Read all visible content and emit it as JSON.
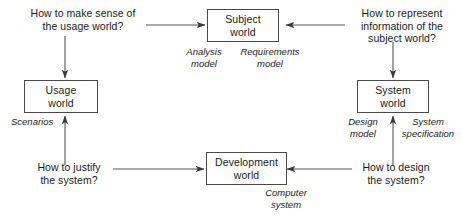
{
  "diagram": {
    "canvas": {
      "width": 462,
      "height": 222,
      "background": "#ffffff"
    },
    "stroke_color": "#555555",
    "box_border_color": "#4a4a4a",
    "text_color": "#1a1a1a",
    "nodes": [
      {
        "id": "usage-world",
        "line1": "Usage",
        "line2": "world"
      },
      {
        "id": "subject-world",
        "line1": "Subject",
        "line2": "world"
      },
      {
        "id": "system-world",
        "line1": "System",
        "line2": "world"
      },
      {
        "id": "development-world",
        "line1": "Development",
        "line2": "world"
      }
    ],
    "questions": [
      {
        "id": "question-usage",
        "line1": "How to make sense of",
        "line2": "the usage world?",
        "line3": ""
      },
      {
        "id": "question-subject",
        "line1": "How to represent",
        "line2": "information of the",
        "line3": "subject world?"
      },
      {
        "id": "question-justify",
        "line1": "How to justify",
        "line2": "the system?",
        "line3": ""
      },
      {
        "id": "question-design",
        "line1": "How to design",
        "line2": "the system?",
        "line3": ""
      }
    ],
    "edge_labels": [
      {
        "id": "analysis-model",
        "line1": "Analysis",
        "line2": "model"
      },
      {
        "id": "requirements-model",
        "line1": "Requirements",
        "line2": "model"
      },
      {
        "id": "scenarios",
        "line1": "Scenarios",
        "line2": ""
      },
      {
        "id": "design-model",
        "line1": "Design",
        "line2": "model"
      },
      {
        "id": "system-specification",
        "line1": "System",
        "line2": "specification"
      },
      {
        "id": "computer-system",
        "line1": "Computer",
        "line2": "system"
      }
    ]
  }
}
